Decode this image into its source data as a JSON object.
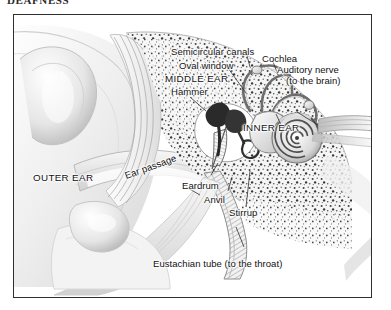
{
  "page": {
    "heading": "DEAFNESS",
    "background_color": "#ffffff",
    "frame_border_color": "#2f2f2f"
  },
  "figure": {
    "style": "grayscale pen-and-ink anatomical illustration",
    "ink_color": "#111111",
    "labels": [
      {
        "id": "semicircular-canals",
        "text": "Semicircular canals",
        "x": 170,
        "y": 46,
        "type": "part"
      },
      {
        "id": "cochlea",
        "text": "Cochlea",
        "x": 261,
        "y": 53,
        "type": "part"
      },
      {
        "id": "oval-window",
        "text": "Oval window",
        "x": 178,
        "y": 60,
        "type": "part"
      },
      {
        "id": "auditory-nerve",
        "text": "Auditory nerve",
        "x": 276,
        "y": 64,
        "type": "part"
      },
      {
        "id": "middle-ear",
        "text": "MIDDLE EAR",
        "x": 164,
        "y": 73,
        "type": "region"
      },
      {
        "id": "to-the-brain",
        "text": "(to the brain)",
        "x": 285,
        "y": 75,
        "type": "annotation"
      },
      {
        "id": "hammer",
        "text": "Hammer",
        "x": 170,
        "y": 86,
        "type": "part"
      },
      {
        "id": "inner-ear",
        "text": "INNER EAR",
        "x": 242,
        "y": 122,
        "type": "region"
      },
      {
        "id": "ear-passage",
        "text": "Ear passage",
        "x": 126,
        "y": 170,
        "type": "part"
      },
      {
        "id": "outer-ear",
        "text": "OUTER EAR",
        "x": 32,
        "y": 172,
        "type": "region"
      },
      {
        "id": "eardrum",
        "text": "Eardrum",
        "x": 181,
        "y": 180,
        "type": "part"
      },
      {
        "id": "anvil",
        "text": "Anvil",
        "x": 203,
        "y": 194,
        "type": "part"
      },
      {
        "id": "stirrup",
        "text": "Stirrup",
        "x": 228,
        "y": 207,
        "type": "part"
      },
      {
        "id": "eustachian-tube",
        "text": "Eustachian tube (to the throat)",
        "x": 152,
        "y": 258,
        "type": "part"
      }
    ]
  }
}
